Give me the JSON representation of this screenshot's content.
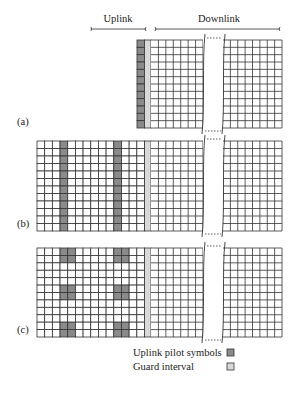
{
  "header": {
    "uplink_label": "Uplink",
    "downlink_label": "Downlink"
  },
  "colors": {
    "pilot": "#8a8a8a",
    "guard": "#d9d9d9",
    "cell": "#ffffff",
    "line": "#333333"
  },
  "grid": {
    "rows": 12,
    "cell_w": 7.5,
    "break_left_x": 203,
    "break_right_x": 223,
    "right_end_x": 282,
    "guard_x": 144.5,
    "guard_w": 6.5
  },
  "panels": [
    {
      "label": "(a)",
      "label_y": 125,
      "top": 40,
      "bottom": 128,
      "start_x": 137,
      "uplink_columns": 1,
      "pilot_cells": "full-column-0"
    },
    {
      "label": "(b)",
      "label_y": 227,
      "top": 141,
      "bottom": 231,
      "start_x": 37,
      "uplink_columns": 14,
      "pilot_columns": [
        3,
        10
      ]
    },
    {
      "label": "(c)",
      "label_y": 333,
      "top": 248,
      "bottom": 337,
      "start_x": 37,
      "uplink_columns": 14,
      "pilot_blocks": [
        {
          "cols": [
            3,
            4
          ],
          "rows": [
            0,
            1
          ]
        },
        {
          "cols": [
            3,
            4
          ],
          "rows": [
            5,
            6
          ]
        },
        {
          "cols": [
            3,
            4
          ],
          "rows": [
            10,
            11
          ]
        },
        {
          "cols": [
            10,
            11
          ],
          "rows": [
            0,
            1
          ]
        },
        {
          "cols": [
            10,
            11
          ],
          "rows": [
            5,
            6
          ]
        },
        {
          "cols": [
            10,
            11
          ],
          "rows": [
            10,
            11
          ]
        }
      ]
    }
  ],
  "legend": {
    "items": [
      {
        "label": "Uplink pilot symbols",
        "swatch": "pilot"
      },
      {
        "label": "Guard interval",
        "swatch": "guard"
      }
    ]
  }
}
